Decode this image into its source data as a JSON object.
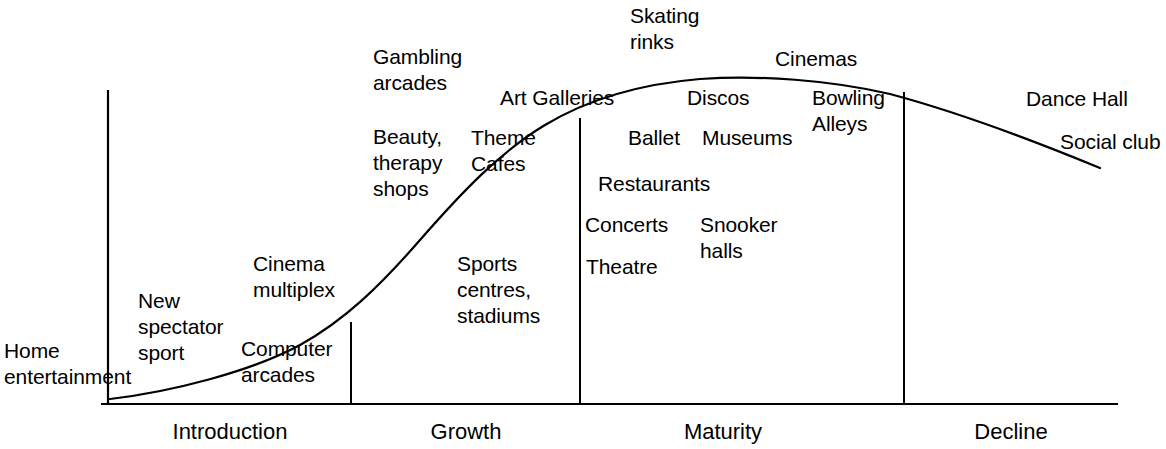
{
  "diagram": {
    "type": "product-lifecycle-s-curve",
    "axis": {
      "y_axis_x": 108,
      "y_axis_top": 90,
      "baseline_y": 404,
      "baseline_x_start": 101,
      "baseline_x_end": 1118
    },
    "phases": [
      {
        "id": "introduction",
        "label": "Introduction",
        "center_x": 230,
        "label_y": 419,
        "divider_x": 351,
        "divider_top": 322
      },
      {
        "id": "growth",
        "label": "Growth",
        "center_x": 466,
        "label_y": 419,
        "divider_x": 580,
        "divider_top": 118
      },
      {
        "id": "maturity",
        "label": "Maturity",
        "center_x": 723,
        "label_y": 419,
        "divider_x": 904,
        "divider_top": 92
      },
      {
        "id": "decline",
        "label": "Decline",
        "center_x": 1011,
        "label_y": 419,
        "divider_x": null,
        "divider_top": null
      }
    ],
    "curve": {
      "stroke": "#000000",
      "stroke_width": 2.2,
      "path": "M 110 399 C 170 392, 250 372, 300 345 C 345 320, 380 286, 420 240 C 462 192, 500 152, 545 125 C 590 98, 640 84, 700 79 C 760 75, 830 80, 890 94 C 950 110, 1020 135, 1100 168"
    },
    "labels": [
      {
        "id": "home-entertainment",
        "text": "Home\nentertainment",
        "x": 4,
        "y": 338,
        "phase": "introduction"
      },
      {
        "id": "new-spectator-sport",
        "text": "New\nspectator\nsport",
        "x": 138,
        "y": 288,
        "phase": "introduction"
      },
      {
        "id": "cinema-multiplex",
        "text": "Cinema\nmultiplex",
        "x": 253,
        "y": 251,
        "phase": "introduction"
      },
      {
        "id": "computer-arcades",
        "text": "Computer\narcades",
        "x": 241,
        "y": 336,
        "phase": "introduction"
      },
      {
        "id": "gambling-arcades",
        "text": "Gambling\narcades",
        "x": 373,
        "y": 44,
        "phase": "growth"
      },
      {
        "id": "beauty-therapy-shops",
        "text": "Beauty,\ntherapy\nshops",
        "x": 373,
        "y": 124,
        "phase": "growth"
      },
      {
        "id": "theme-cafes",
        "text": "Theme\nCafes",
        "x": 471,
        "y": 125,
        "phase": "growth"
      },
      {
        "id": "sports-centres-stadiums",
        "text": "Sports\ncentres,\nstadiums",
        "x": 457,
        "y": 251,
        "phase": "growth"
      },
      {
        "id": "art-galleries",
        "text": "Art Galleries",
        "x": 500,
        "y": 85,
        "phase": "growth"
      },
      {
        "id": "skating-rinks",
        "text": "Skating\nrinks",
        "x": 630,
        "y": 3,
        "phase": "maturity"
      },
      {
        "id": "cinemas",
        "text": "Cinemas",
        "x": 775,
        "y": 46,
        "phase": "maturity"
      },
      {
        "id": "discos",
        "text": "Discos",
        "x": 687,
        "y": 85,
        "phase": "maturity"
      },
      {
        "id": "bowling-alleys",
        "text": "Bowling\nAlleys",
        "x": 812,
        "y": 85,
        "phase": "maturity"
      },
      {
        "id": "ballet",
        "text": "Ballet",
        "x": 628,
        "y": 125,
        "phase": "maturity"
      },
      {
        "id": "museums",
        "text": "Museums",
        "x": 702,
        "y": 125,
        "phase": "maturity"
      },
      {
        "id": "restaurants",
        "text": "Restaurants",
        "x": 598,
        "y": 171,
        "phase": "maturity"
      },
      {
        "id": "concerts",
        "text": "Concerts",
        "x": 585,
        "y": 212,
        "phase": "maturity"
      },
      {
        "id": "snooker-halls",
        "text": "Snooker\nhalls",
        "x": 700,
        "y": 212,
        "phase": "maturity"
      },
      {
        "id": "theatre",
        "text": "Theatre",
        "x": 586,
        "y": 254,
        "phase": "maturity"
      },
      {
        "id": "dance-hall",
        "text": "Dance Hall",
        "x": 1026,
        "y": 86,
        "phase": "decline"
      },
      {
        "id": "social-club",
        "text": "Social club",
        "x": 1060,
        "y": 129,
        "phase": "decline"
      }
    ]
  }
}
